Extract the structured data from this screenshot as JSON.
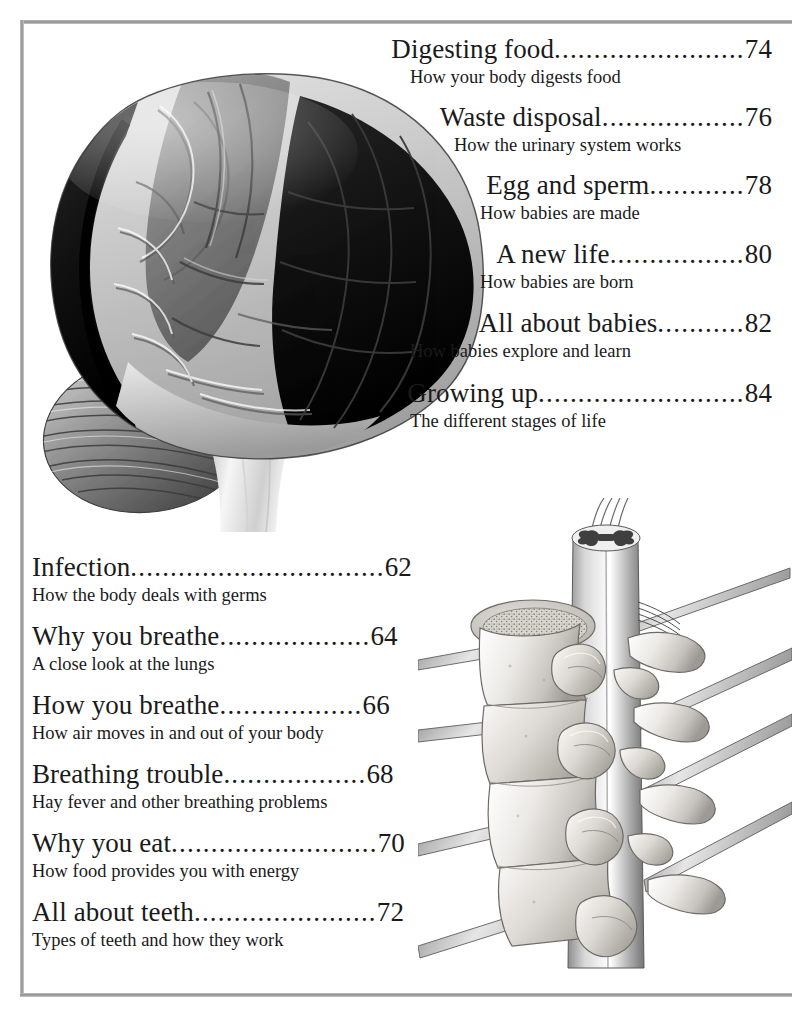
{
  "page": {
    "background_color": "#ffffff",
    "text_color": "#1a1a1a",
    "rule_color": "#9a9a9a"
  },
  "toc_right": {
    "entries": [
      {
        "title": "Digesting food",
        "dots": "........................",
        "page": "74",
        "subtitle": "How your body digests food"
      },
      {
        "title": "Waste disposal",
        "dots": "..................",
        "page": "76",
        "subtitle": "How the urinary system works"
      },
      {
        "title": "Egg and sperm",
        "dots": "............",
        "page": "78",
        "subtitle": "How babies are made"
      },
      {
        "title": "A new life",
        "dots": ".................",
        "page": "80",
        "subtitle": "How babies are born"
      },
      {
        "title": "All about babies",
        "dots": "...........",
        "page": "82",
        "subtitle": "How babies explore and learn"
      },
      {
        "title": "Growing up",
        "dots": "..........................",
        "page": "84",
        "subtitle": "The different stages of life"
      }
    ]
  },
  "toc_left": {
    "entries": [
      {
        "title": "Infection",
        "dots": "................................",
        "page": "62",
        "subtitle": "How the body deals with germs"
      },
      {
        "title": "Why you breathe",
        "dots": "...................",
        "page": "64",
        "subtitle": "A close look at the lungs"
      },
      {
        "title": "How you breathe",
        "dots": "..................",
        "page": "66",
        "subtitle": "How air moves in and out of your body"
      },
      {
        "title": "Breathing trouble",
        "dots": "..................",
        "page": "68",
        "subtitle": "Hay fever and other breathing problems"
      },
      {
        "title": "Why you eat",
        "dots": "..........................",
        "page": "70",
        "subtitle": "How food provides you with energy"
      },
      {
        "title": "All about teeth",
        "dots": ".......................",
        "page": "72",
        "subtitle": "Types of teeth and how they work"
      }
    ]
  },
  "illustrations": {
    "brain": {
      "name": "human-brain-lateral-view",
      "regions": [
        "frontal-lobe-dark",
        "parietal-lobe-light",
        "motor-strip-mid-gray",
        "occipital-lobe-dark",
        "temporal-lobe-light",
        "cerebellum",
        "brain-stem"
      ],
      "palette": {
        "dark": "#121212",
        "mid": "#7d7d7d",
        "light": "#c9c9c9",
        "highlight": "#f2f2f2",
        "shadow": "#4a4a4a"
      }
    },
    "spine": {
      "name": "vertebrae-with-spinal-cord-and-nerve-roots",
      "parts": [
        "spinal-cord",
        "gray-matter-cross-section",
        "vertebral-body",
        "cancellous-bone-disc",
        "transverse-process",
        "spinous-process",
        "nerve-roots"
      ],
      "palette": {
        "bone": "#e8e6e2",
        "bone_shadow": "#9d9a95",
        "cord": "#bfbfbf",
        "cord_shadow": "#6e6e6e",
        "outline": "#4a4a4a"
      }
    }
  }
}
